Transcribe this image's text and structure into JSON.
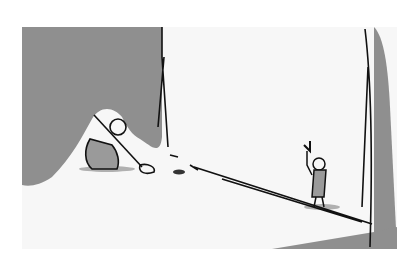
{
  "scene": {
    "type": "storyboard-sketch",
    "description": "Two small figures in a bright corridor; one digging with a shovel on the left, one holding a torch on the right; a long pole/line across the floor",
    "colors": {
      "background": "#ffffff",
      "frame": "#f7f7f7",
      "shadow": "#8f8f8f",
      "ink": "#111111",
      "figure_fill": "#9a9a9a"
    },
    "figures": [
      {
        "id": "digger",
        "action": "digging with shovel"
      },
      {
        "id": "torch-bearer",
        "action": "holding torch"
      }
    ]
  }
}
